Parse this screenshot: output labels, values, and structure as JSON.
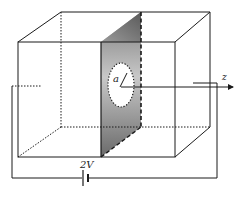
{
  "diagram": {
    "labels": {
      "radius": "a",
      "axis": "z",
      "battery": "2V"
    },
    "colors": {
      "line": "#1a1a1a",
      "plate_dark": "#5a5a5a",
      "plate_light": "#d8d8d8",
      "background": "#ffffff"
    }
  }
}
